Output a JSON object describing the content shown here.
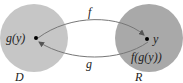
{
  "diagram": {
    "domain_set": {
      "label": "D",
      "point_label": "g(y)",
      "color": "#c6c6c6"
    },
    "range_set": {
      "label": "R",
      "point_label": "y",
      "composite_label": "f(g(y))",
      "color": "#a9a9a9"
    },
    "arrows": [
      {
        "name": "f",
        "label": "f",
        "from": "D",
        "to": "R"
      },
      {
        "name": "g",
        "label": "g",
        "from": "R",
        "to": "D"
      }
    ],
    "arrow_color": "#777777"
  }
}
